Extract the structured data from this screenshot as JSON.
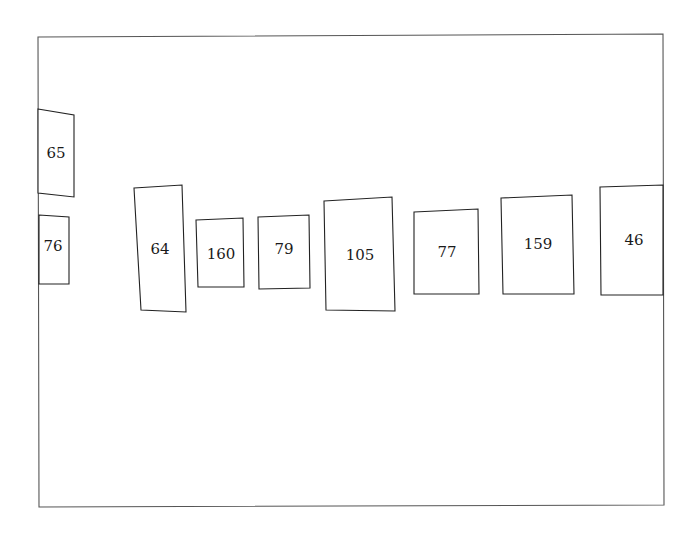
{
  "diagram": {
    "frame": {
      "points": [
        [
          38,
          37
        ],
        [
          663,
          34
        ],
        [
          664,
          505
        ],
        [
          39,
          507
        ]
      ],
      "stroke": "#555555"
    },
    "boxes": [
      {
        "label": "65",
        "points": [
          [
            38,
            109
          ],
          [
            74,
            115
          ],
          [
            74,
            197
          ],
          [
            38,
            193
          ]
        ],
        "text_pos": [
          56,
          154
        ]
      },
      {
        "label": "76",
        "points": [
          [
            39,
            215
          ],
          [
            69,
            217
          ],
          [
            69,
            284
          ],
          [
            39,
            284
          ]
        ],
        "text_pos": [
          53,
          247
        ]
      },
      {
        "label": "64",
        "points": [
          [
            134,
            188
          ],
          [
            182,
            185
          ],
          [
            186,
            312
          ],
          [
            141,
            310
          ]
        ],
        "text_pos": [
          160,
          250
        ]
      },
      {
        "label": "160",
        "points": [
          [
            196,
            220
          ],
          [
            243,
            218
          ],
          [
            244,
            287
          ],
          [
            198,
            287
          ]
        ],
        "text_pos": [
          221,
          255
        ]
      },
      {
        "label": "79",
        "points": [
          [
            258,
            217
          ],
          [
            309,
            215
          ],
          [
            310,
            288
          ],
          [
            259,
            289
          ]
        ],
        "text_pos": [
          284,
          250
        ]
      },
      {
        "label": "105",
        "points": [
          [
            324,
            201
          ],
          [
            392,
            197
          ],
          [
            395,
            311
          ],
          [
            326,
            310
          ]
        ],
        "text_pos": [
          360,
          256
        ]
      },
      {
        "label": "77",
        "points": [
          [
            414,
            212
          ],
          [
            478,
            209
          ],
          [
            479,
            294
          ],
          [
            414,
            294
          ]
        ],
        "text_pos": [
          447,
          253
        ]
      },
      {
        "label": "159",
        "points": [
          [
            501,
            198
          ],
          [
            572,
            195
          ],
          [
            574,
            294
          ],
          [
            503,
            294
          ]
        ],
        "text_pos": [
          538,
          245
        ]
      },
      {
        "label": "46",
        "points": [
          [
            600,
            187
          ],
          [
            663,
            185
          ],
          [
            663,
            295
          ],
          [
            601,
            295
          ]
        ],
        "text_pos": [
          634,
          241
        ]
      }
    ]
  }
}
